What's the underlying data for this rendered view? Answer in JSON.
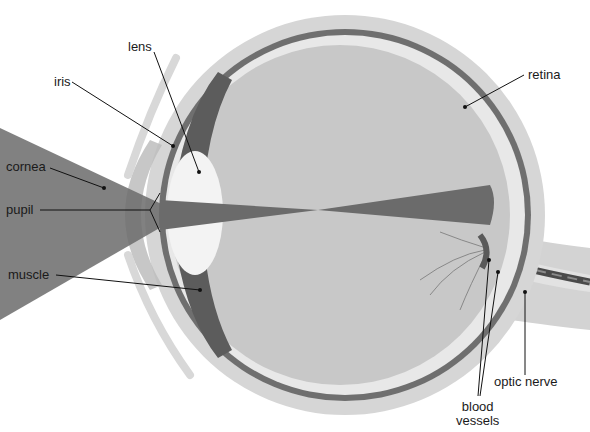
{
  "diagram": {
    "colors": {
      "background": "#ffffff",
      "light_beam": "#7a7a7a",
      "sclera": "#d4d4d4",
      "choroid": "#6e6e6e",
      "retina": "#e6e6e6",
      "vitreous": "#c6c6c6",
      "lens": "#f2f2f2",
      "nerve": "#d0d0d0",
      "vessel": "#4a4a4a",
      "leader_line": "#111111"
    },
    "labels": [
      {
        "id": "lens",
        "text": "lens"
      },
      {
        "id": "iris",
        "text": "iris"
      },
      {
        "id": "cornea",
        "text": "cornea"
      },
      {
        "id": "pupil",
        "text": "pupil"
      },
      {
        "id": "muscle",
        "text": "muscle"
      },
      {
        "id": "retina",
        "text": "retina"
      },
      {
        "id": "optic_nerve",
        "text": "optic nerve"
      },
      {
        "id": "blood_vessels",
        "text": "blood\nvessels"
      }
    ]
  }
}
